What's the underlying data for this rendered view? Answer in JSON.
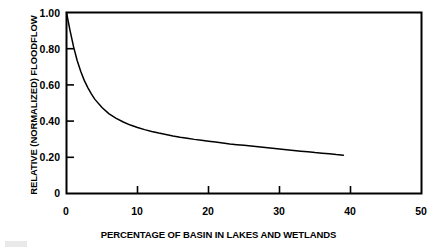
{
  "figure": {
    "background_color": "#ffffff",
    "line_color": "#000000",
    "axis_color": "#000000"
  },
  "chart_data": {
    "type": "line",
    "title": "",
    "subtitle": "",
    "xlabel": "PERCENTAGE OF BASIN IN LAKES AND WETLANDS",
    "ylabel": "RELATIVE (NORMALIZED) FLOODFLOW",
    "xlim": [
      0,
      50
    ],
    "ylim": [
      0,
      1.0
    ],
    "grid": false,
    "legend": null,
    "legend_position": "none",
    "xticks": [
      0,
      10,
      20,
      30,
      40,
      50
    ],
    "xtick_labels": [
      "0",
      "10",
      "20",
      "30",
      "40",
      "50"
    ],
    "yticks": [
      0,
      0.2,
      0.4,
      0.6,
      0.8,
      1.0
    ],
    "ytick_labels": [
      "0",
      "0.20",
      "0.40",
      "0.60",
      "0.80",
      "1.00"
    ],
    "annotations": [],
    "series": [
      {
        "name": "Relative floodflow",
        "x": [
          0,
          0.5,
          1,
          1.5,
          2,
          2.5,
          3,
          3.5,
          4,
          5,
          6,
          7,
          8,
          9,
          10,
          11,
          12,
          13,
          14,
          15,
          16,
          17,
          18,
          19,
          20,
          21,
          22,
          23,
          24,
          25,
          26,
          27,
          28,
          29,
          30,
          31,
          32,
          33,
          34,
          35,
          36,
          37,
          38,
          39
        ],
        "values": [
          1.0,
          0.9,
          0.81,
          0.735,
          0.675,
          0.625,
          0.585,
          0.55,
          0.52,
          0.475,
          0.44,
          0.415,
          0.395,
          0.378,
          0.365,
          0.353,
          0.343,
          0.334,
          0.326,
          0.318,
          0.311,
          0.305,
          0.299,
          0.294,
          0.289,
          0.284,
          0.279,
          0.274,
          0.27,
          0.266,
          0.262,
          0.258,
          0.254,
          0.25,
          0.246,
          0.242,
          0.238,
          0.234,
          0.23,
          0.226,
          0.223,
          0.219,
          0.215,
          0.212
        ]
      }
    ]
  }
}
